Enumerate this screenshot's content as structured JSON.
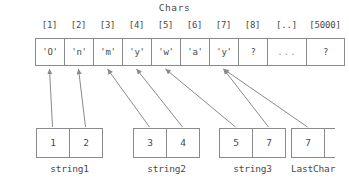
{
  "array": {
    "title": "Chars",
    "index_labels": [
      "[1]",
      "[2]",
      "[3]",
      "[4]",
      "[5]",
      "[6]",
      "[7]",
      "[8]",
      "[..]",
      "[5000]"
    ],
    "cells": [
      {
        "index": "[1]",
        "value": "'O'"
      },
      {
        "index": "[2]",
        "value": "'n'"
      },
      {
        "index": "[3]",
        "value": "'m'"
      },
      {
        "index": "[4]",
        "value": "'y'"
      },
      {
        "index": "[5]",
        "value": "'w'"
      },
      {
        "index": "[6]",
        "value": "'a'"
      },
      {
        "index": "[7]",
        "value": "'y'"
      },
      {
        "index": "[8]",
        "value": "?"
      },
      {
        "index": "[..]",
        "value": "..."
      },
      {
        "index": "[5000]",
        "value": "?"
      }
    ]
  },
  "variables": [
    {
      "name": "string1",
      "label": "string1",
      "cells": [
        {
          "value": "1",
          "points_to": "[1]"
        },
        {
          "value": "2",
          "points_to": "[2]"
        }
      ]
    },
    {
      "name": "string2",
      "label": "string2",
      "cells": [
        {
          "value": "3",
          "points_to": "[3]"
        },
        {
          "value": "4",
          "points_to": "[4]"
        }
      ]
    },
    {
      "name": "string3",
      "label": "string3",
      "cells": [
        {
          "value": "5",
          "points_to": "[5]"
        },
        {
          "value": "7",
          "points_to": "[7]"
        }
      ]
    },
    {
      "name": "LastChar",
      "label": "LastChar",
      "cells": [
        {
          "value": "7",
          "points_to": "[7]"
        }
      ]
    }
  ],
  "colors": {
    "line": "#8a8a8a",
    "text": "#4a4a4a",
    "muted": "#9a9a9a",
    "background": "#ffffff"
  }
}
